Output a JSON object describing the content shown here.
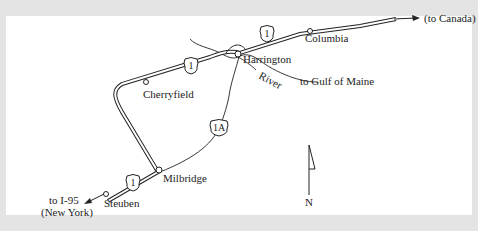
{
  "map": {
    "places": {
      "columbia": "Columbia",
      "harrington": "Harrington",
      "cherryfield": "Cherryfield",
      "milbridge": "Milbridge",
      "steuben": "Steuben"
    },
    "directions": {
      "canada": "(to Canada)",
      "gulf": "to Gulf of Maine",
      "i95_line1": "to I-95",
      "i95_line2": "(New York)"
    },
    "river_label": "River",
    "routes": {
      "us1_a": "1",
      "us1_b": "1",
      "us1_c": "1",
      "us1a": "1A"
    },
    "compass": "N",
    "colors": {
      "background": "#e4e4e4",
      "panel": "#ffffff",
      "ink": "#222222"
    }
  }
}
